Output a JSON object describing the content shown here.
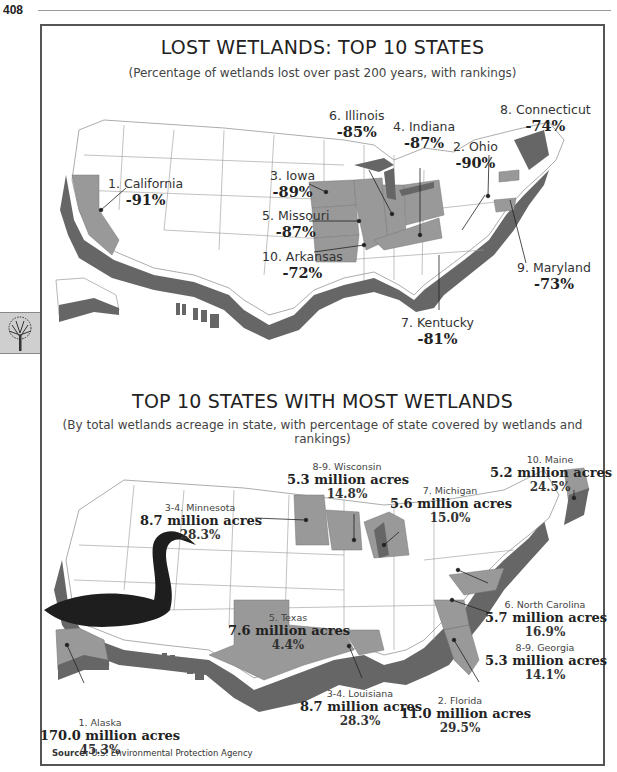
{
  "page": {
    "number": "408"
  },
  "colors": {
    "highlight_state": "#999999",
    "coastal_band": "#666666",
    "land": "#ffffff",
    "border": "#555555",
    "swan": "#1e1e1e"
  },
  "map1": {
    "title": "LOST WETLANDS: TOP 10 STATES",
    "subtitle": "(Percentage of wetlands lost over past 200 years, with rankings)",
    "labels": [
      {
        "rank": "1",
        "state": "1. California",
        "value": "-91%"
      },
      {
        "rank": "2",
        "state": "2. Ohio",
        "value": "-90%"
      },
      {
        "rank": "3",
        "state": "3. Iowa",
        "value": "-89%"
      },
      {
        "rank": "4",
        "state": "4. Indiana",
        "value": "-87%"
      },
      {
        "rank": "5",
        "state": "5. Missouri",
        "value": "-87%"
      },
      {
        "rank": "6",
        "state": "6. Illinois",
        "value": "-85%"
      },
      {
        "rank": "7",
        "state": "7. Kentucky",
        "value": "-81%"
      },
      {
        "rank": "8",
        "state": "8. Connecticut",
        "value": "-74%"
      },
      {
        "rank": "9",
        "state": "9. Maryland",
        "value": "-73%"
      },
      {
        "rank": "10",
        "state": "10. Arkansas",
        "value": "-72%"
      }
    ]
  },
  "map2": {
    "title": "TOP 10 STATES WITH MOST WETLANDS",
    "subtitle": "(By total wetlands acreage in state, with  percentage of state covered by wetlands and rankings)",
    "labels": [
      {
        "state": "1. Alaska",
        "acres": "170.0 million acres",
        "pct": "45.3%"
      },
      {
        "state": "2. Florida",
        "acres": "11.0 million acres",
        "pct": "29.5%"
      },
      {
        "state": "3-4. Louisiana",
        "acres": "8.7 million acres",
        "pct": "28.3%"
      },
      {
        "state": "3-4. Minnesota",
        "acres": "8.7 million acres",
        "pct": "28.3%"
      },
      {
        "state": "5. Texas",
        "acres": "7.6 million acres",
        "pct": "4.4%"
      },
      {
        "state": "6. North Carolina",
        "acres": "5.7 million acres",
        "pct": "16.9%"
      },
      {
        "state": "7. Michigan",
        "acres": "5.6 million acres",
        "pct": "15.0%"
      },
      {
        "state": "8-9. Wisconsin",
        "acres": "5.3 million acres",
        "pct": "14.8%"
      },
      {
        "state": "8-9. Georgia",
        "acres": "5.3 million acres",
        "pct": "14.1%"
      },
      {
        "state": "10. Maine",
        "acres": "5.2 million acres",
        "pct": "24.5%"
      }
    ]
  },
  "source": {
    "label": "Source:",
    "text": "U.S. Environmental Protection Agency"
  }
}
